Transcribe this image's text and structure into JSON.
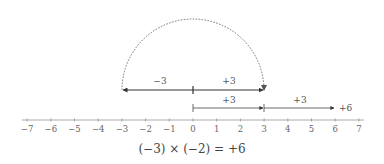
{
  "diagram": {
    "axis": {
      "min": -7,
      "max": 7,
      "ticks": [
        "−7",
        "−6",
        "−5",
        "−4",
        "−3",
        "−2",
        "−1",
        "0",
        "1",
        "2",
        "3",
        "4",
        "5",
        "6",
        "7"
      ]
    },
    "upper_row": {
      "left_label": "−3",
      "right_label": "+3"
    },
    "lower_row": {
      "first_label": "+3",
      "second_label": "+3",
      "end_label": "+6"
    },
    "equation": "(−3) × (−2) = +6",
    "colors": {
      "line": "#333333",
      "axis": "#888888",
      "arc": "#555555"
    }
  }
}
